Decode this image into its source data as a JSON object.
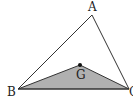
{
  "diagram": {
    "type": "geometry-triangle",
    "vertices": {
      "A": {
        "label": "A",
        "x": 92,
        "y": 15
      },
      "B": {
        "label": "B",
        "x": 18,
        "y": 89
      },
      "C": {
        "label": "C",
        "x": 129,
        "y": 89
      }
    },
    "points": {
      "G": {
        "label": "G",
        "x": 80,
        "y": 65
      }
    },
    "shaded_region": {
      "vertices": [
        "B",
        "G",
        "C"
      ],
      "fill": "#b0b0b0"
    },
    "colors": {
      "stroke": "#333333",
      "shade": "#b0b0b0",
      "point": "#111111"
    }
  }
}
